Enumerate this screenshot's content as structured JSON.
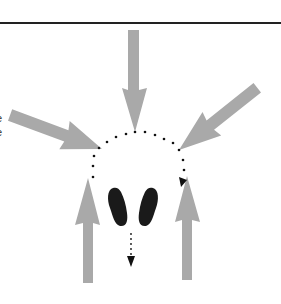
{
  "diagram": {
    "edge_text": [
      "e",
      "e"
    ],
    "colors": {
      "arrow_fill": "#a9a9a9",
      "footprint_fill": "#1a1a1a",
      "dot_color": "#111111",
      "rule_color": "#222222",
      "background": "#ffffff"
    },
    "arrows": [
      {
        "id": "top",
        "direction": "down"
      },
      {
        "id": "left-diagonal",
        "direction": "down-right"
      },
      {
        "id": "right-diagonal",
        "direction": "down-left"
      },
      {
        "id": "bottom-left",
        "direction": "up"
      },
      {
        "id": "bottom-right",
        "direction": "up"
      }
    ],
    "footprints": [
      "left",
      "right"
    ],
    "dotted_path": "arc from left over top to right ending with arrowhead",
    "dotted_down_arrow": "below footprints pointing down"
  }
}
